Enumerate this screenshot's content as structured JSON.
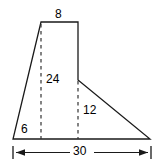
{
  "figure": {
    "type": "geometry-diagram",
    "stroke_color": "#1a1a1a",
    "dash_color": "#333333",
    "background_color": "#ffffff",
    "labels": {
      "top_width": "8",
      "left_height": "24",
      "right_height": "12",
      "left_base": "6",
      "total_width": "30"
    },
    "outline_points": "41,22 78,22 78,80 150,139 13,139",
    "dashed_segments": [
      {
        "name": "left-height-dashed",
        "x1": 41,
        "y1": 24,
        "x2": 41,
        "y2": 139
      },
      {
        "name": "right-height-dashed",
        "x1": 78,
        "y1": 81,
        "x2": 78,
        "y2": 139
      }
    ],
    "dimension_line": {
      "y": 152,
      "x1": 13,
      "x2": 151,
      "tick_top": 146,
      "tick_bottom": 159,
      "label": "30"
    }
  }
}
